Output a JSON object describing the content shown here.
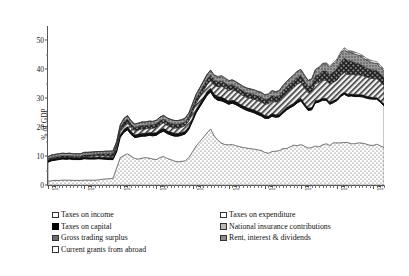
{
  "axes": {
    "ylabel": "% of GDP",
    "yticks": [
      "0",
      "10",
      "20",
      "30",
      "40",
      "50"
    ],
    "xticks": [
      "1900",
      "1910",
      "1920",
      "1930",
      "1940",
      "1950",
      "1960",
      "1970",
      "1980",
      "1990"
    ]
  },
  "legend": {
    "left": [
      {
        "label": "Taxes on income",
        "swatch": "white-square-icon"
      },
      {
        "label": "Taxes on capital",
        "swatch": "black-square-icon"
      },
      {
        "label": "Gross trading surplus",
        "swatch": "crosshatch-square-icon"
      },
      {
        "label": "Current grants from abroad",
        "swatch": "horizontal-lines-square-icon"
      }
    ],
    "right": [
      {
        "label": "Taxes on expenditure",
        "swatch": "dotted-square-icon"
      },
      {
        "label": "National insurance contributions",
        "swatch": "diagonal-hatch-square-icon"
      },
      {
        "label": "Rent, interest & dividends",
        "swatch": "grey-square-icon"
      }
    ]
  },
  "chart_data": {
    "type": "area",
    "title": "",
    "xlabel": "",
    "ylabel": "% of GDP",
    "xlim": [
      1900,
      1993
    ],
    "ylim": [
      0,
      55
    ],
    "grid": false,
    "legend_position": "below",
    "stacked": true,
    "x": [
      1900,
      1901,
      1902,
      1903,
      1904,
      1905,
      1906,
      1907,
      1908,
      1909,
      1910,
      1911,
      1912,
      1913,
      1914,
      1915,
      1916,
      1917,
      1918,
      1919,
      1920,
      1921,
      1922,
      1923,
      1924,
      1925,
      1926,
      1927,
      1928,
      1929,
      1930,
      1931,
      1932,
      1933,
      1934,
      1935,
      1936,
      1937,
      1938,
      1939,
      1940,
      1941,
      1942,
      1943,
      1944,
      1945,
      1946,
      1947,
      1948,
      1949,
      1950,
      1951,
      1952,
      1953,
      1954,
      1955,
      1956,
      1957,
      1958,
      1959,
      1960,
      1961,
      1962,
      1963,
      1964,
      1965,
      1966,
      1967,
      1968,
      1969,
      1970,
      1971,
      1972,
      1973,
      1974,
      1975,
      1976,
      1977,
      1978,
      1979,
      1980,
      1981,
      1982,
      1983,
      1984,
      1985,
      1986,
      1987,
      1988,
      1989,
      1990,
      1991,
      1992,
      1993
    ],
    "series": [
      {
        "name": "Taxes on expenditure",
        "values": [
          1.3,
          1.5,
          1.6,
          1.6,
          1.7,
          1.7,
          1.7,
          1.6,
          1.6,
          1.6,
          1.7,
          1.7,
          1.7,
          1.7,
          1.8,
          2.0,
          2.1,
          2.2,
          2.3,
          6.0,
          9.5,
          10.2,
          10.8,
          10.0,
          9.2,
          9.0,
          9.3,
          9.5,
          9.3,
          9.0,
          8.8,
          9.5,
          9.9,
          9.2,
          8.8,
          8.3,
          8.0,
          8.2,
          8.4,
          9.5,
          11.5,
          13.5,
          15.0,
          16.5,
          18.0,
          19.4,
          17.0,
          15.5,
          14.5,
          14.0,
          13.9,
          14.0,
          13.6,
          13.3,
          13.0,
          12.8,
          12.6,
          12.4,
          12.2,
          12.0,
          11.3,
          11.0,
          11.6,
          11.7,
          11.9,
          12.6,
          12.6,
          13.2,
          13.8,
          13.6,
          14.0,
          13.4,
          12.8,
          13.0,
          13.5,
          13.2,
          13.9,
          14.3,
          13.7,
          14.6,
          14.6,
          14.6,
          14.7,
          14.7,
          14.3,
          14.3,
          14.6,
          14.5,
          14.2,
          13.8,
          13.7,
          14.1,
          13.6,
          13.0
        ]
      },
      {
        "name": "Taxes on income",
        "values": [
          6.6,
          6.9,
          7.0,
          7.2,
          7.3,
          7.2,
          7.3,
          7.2,
          7.2,
          7.2,
          7.4,
          7.3,
          7.3,
          7.3,
          7.3,
          7.0,
          6.8,
          6.6,
          6.5,
          5.5,
          7.0,
          8.0,
          8.3,
          7.5,
          7.2,
          7.6,
          7.6,
          7.4,
          7.9,
          8.0,
          8.4,
          8.6,
          8.7,
          8.6,
          8.5,
          8.6,
          8.9,
          9.0,
          9.3,
          9.8,
          10.6,
          11.5,
          12.0,
          12.5,
          13.0,
          12.8,
          13.2,
          13.8,
          14.6,
          14.6,
          14.0,
          14.3,
          14.2,
          13.8,
          13.4,
          13.0,
          12.8,
          12.6,
          12.2,
          11.9,
          11.8,
          12.0,
          12.2,
          11.7,
          11.7,
          12.2,
          13.3,
          13.5,
          13.6,
          14.8,
          15.1,
          14.0,
          13.0,
          13.0,
          14.9,
          15.5,
          15.4,
          15.0,
          14.2,
          13.9,
          14.6,
          16.0,
          16.7,
          16.0,
          16.5,
          16.3,
          16.0,
          16.0,
          15.9,
          16.0,
          16.0,
          15.6,
          15.0,
          14.4
        ]
      },
      {
        "name": "Taxes on capital",
        "values": [
          0.6,
          0.6,
          0.6,
          0.6,
          0.6,
          0.6,
          0.6,
          0.6,
          0.6,
          0.6,
          0.6,
          0.6,
          0.6,
          0.6,
          0.6,
          0.6,
          0.7,
          0.7,
          0.7,
          0.8,
          1.0,
          1.1,
          1.1,
          1.0,
          1.0,
          1.0,
          1.0,
          1.0,
          1.0,
          1.0,
          1.0,
          1.0,
          1.0,
          1.0,
          1.0,
          1.0,
          1.0,
          1.0,
          1.0,
          1.0,
          1.1,
          1.2,
          1.2,
          1.2,
          1.3,
          1.3,
          1.3,
          1.3,
          1.3,
          1.2,
          1.1,
          1.1,
          1.1,
          1.0,
          1.0,
          1.0,
          1.0,
          1.0,
          1.0,
          1.0,
          0.9,
          0.9,
          0.9,
          0.9,
          0.9,
          0.9,
          0.9,
          0.9,
          0.9,
          0.9,
          0.9,
          0.8,
          0.8,
          0.8,
          0.8,
          0.7,
          0.7,
          0.7,
          0.7,
          0.7,
          0.7,
          0.7,
          0.7,
          0.7,
          0.7,
          0.7,
          0.7,
          0.7,
          0.7,
          0.7,
          0.6,
          0.6,
          0.6,
          0.6
        ]
      },
      {
        "name": "National insurance contributions",
        "values": [
          0.0,
          0.0,
          0.0,
          0.0,
          0.0,
          0.0,
          0.0,
          0.0,
          0.0,
          0.0,
          0.2,
          0.3,
          0.4,
          0.5,
          0.5,
          0.5,
          0.5,
          0.5,
          0.5,
          0.7,
          1.0,
          1.2,
          1.3,
          1.3,
          1.3,
          1.4,
          1.5,
          1.5,
          1.5,
          1.6,
          1.7,
          1.8,
          1.9,
          1.8,
          1.8,
          1.8,
          1.8,
          1.8,
          1.9,
          1.9,
          2.0,
          2.1,
          2.2,
          2.3,
          2.4,
          2.6,
          3.0,
          3.4,
          3.8,
          3.8,
          3.7,
          3.6,
          3.6,
          3.6,
          3.5,
          3.5,
          3.6,
          3.7,
          3.8,
          3.9,
          4.0,
          4.2,
          4.4,
          4.4,
          4.5,
          4.8,
          5.0,
          5.2,
          5.5,
          5.6,
          5.5,
          5.4,
          5.3,
          5.4,
          5.8,
          6.1,
          6.4,
          6.2,
          6.3,
          6.3,
          6.4,
          6.6,
          6.8,
          6.8,
          6.8,
          6.8,
          6.8,
          6.7,
          6.6,
          6.5,
          6.5,
          6.5,
          6.5,
          6.4
        ]
      },
      {
        "name": "Gross trading surplus",
        "values": [
          0.5,
          0.5,
          0.5,
          0.5,
          0.5,
          0.5,
          0.5,
          0.5,
          0.5,
          0.5,
          0.5,
          0.5,
          0.5,
          0.5,
          0.5,
          0.6,
          0.7,
          0.8,
          0.9,
          1.0,
          1.2,
          1.3,
          1.3,
          1.2,
          1.2,
          1.2,
          1.2,
          1.2,
          1.2,
          1.2,
          1.3,
          1.3,
          1.3,
          1.3,
          1.3,
          1.3,
          1.3,
          1.3,
          1.3,
          1.4,
          1.5,
          1.6,
          1.7,
          1.8,
          1.9,
          1.9,
          1.8,
          1.7,
          1.7,
          1.7,
          1.7,
          1.7,
          1.6,
          1.6,
          1.6,
          1.6,
          1.6,
          1.6,
          1.6,
          1.6,
          1.6,
          1.7,
          1.8,
          1.8,
          1.9,
          2.0,
          2.1,
          2.2,
          2.3,
          2.4,
          2.4,
          2.3,
          2.2,
          2.3,
          2.6,
          2.8,
          3.0,
          3.2,
          3.3,
          3.6,
          4.0,
          4.6,
          5.0,
          4.8,
          4.5,
          4.2,
          3.8,
          3.5,
          3.2,
          3.0,
          2.9,
          2.8,
          2.7,
          2.6
        ]
      },
      {
        "name": "Rent, interest & dividends",
        "values": [
          0.8,
          0.9,
          0.9,
          0.9,
          0.9,
          0.9,
          0.9,
          0.9,
          0.9,
          0.9,
          0.9,
          0.9,
          0.9,
          0.9,
          0.9,
          0.9,
          0.9,
          0.9,
          0.9,
          1.0,
          1.1,
          1.2,
          1.2,
          1.2,
          1.2,
          1.2,
          1.2,
          1.2,
          1.2,
          1.2,
          1.2,
          1.3,
          1.3,
          1.3,
          1.3,
          1.3,
          1.3,
          1.3,
          1.3,
          1.3,
          1.4,
          1.5,
          1.5,
          1.6,
          1.6,
          1.7,
          1.6,
          1.6,
          1.6,
          1.6,
          1.6,
          1.6,
          1.6,
          1.6,
          1.6,
          1.6,
          1.6,
          1.6,
          1.6,
          1.6,
          1.6,
          1.6,
          1.7,
          1.7,
          1.7,
          1.8,
          1.8,
          1.9,
          1.9,
          2.0,
          2.0,
          2.0,
          2.0,
          2.1,
          2.2,
          2.3,
          2.4,
          2.5,
          2.6,
          2.7,
          2.8,
          2.9,
          3.0,
          3.0,
          3.0,
          3.0,
          3.0,
          2.9,
          2.8,
          2.7,
          2.6,
          2.5,
          2.4,
          2.4
        ]
      },
      {
        "name": "Current grants from abroad",
        "values": [
          0.0,
          0.0,
          0.0,
          0.0,
          0.0,
          0.0,
          0.0,
          0.0,
          0.0,
          0.0,
          0.0,
          0.0,
          0.0,
          0.0,
          0.0,
          0.0,
          0.0,
          0.0,
          0.0,
          0.0,
          0.0,
          0.0,
          0.0,
          0.0,
          0.0,
          0.0,
          0.0,
          0.0,
          0.0,
          0.0,
          0.0,
          0.0,
          0.0,
          0.0,
          0.0,
          0.0,
          0.0,
          0.0,
          0.0,
          0.0,
          0.0,
          0.0,
          0.0,
          0.0,
          0.0,
          0.1,
          0.2,
          0.3,
          0.4,
          0.3,
          0.2,
          0.1,
          0.1,
          0.1,
          0.1,
          0.1,
          0.1,
          0.1,
          0.1,
          0.1,
          0.1,
          0.1,
          0.1,
          0.1,
          0.1,
          0.1,
          0.1,
          0.1,
          0.1,
          0.1,
          0.1,
          0.1,
          0.1,
          0.2,
          0.2,
          0.3,
          0.3,
          0.4,
          0.4,
          0.5,
          0.5,
          0.6,
          0.6,
          0.6,
          0.6,
          0.6,
          0.6,
          0.6,
          0.6,
          0.6,
          0.6,
          0.6,
          0.6,
          0.6
        ]
      }
    ]
  }
}
